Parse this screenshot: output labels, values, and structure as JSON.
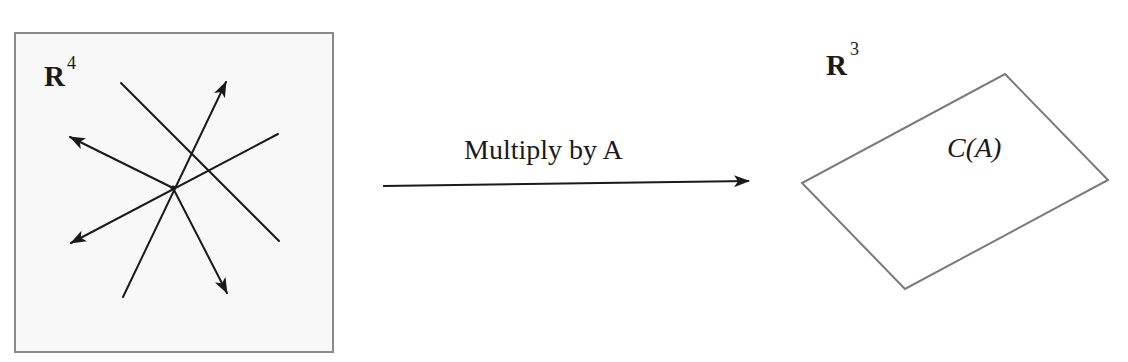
{
  "diagram": {
    "type": "linear-map-column-space",
    "domain_space": {
      "label": "R",
      "exponent": "4",
      "box": {
        "x": 15,
        "y": 33,
        "width": 318,
        "height": 319,
        "stroke": "#8a8a8a",
        "fill": "#f8f8f8"
      },
      "center": [
        173,
        188
      ],
      "lines": [
        {
          "name": "line-1",
          "from": [
            121,
            83
          ],
          "to": [
            279,
            241
          ],
          "arrow_end": false,
          "arrow_start": false
        },
        {
          "name": "line-2",
          "from": [
            123,
            297
          ],
          "to": [
            226,
            82
          ],
          "arrow_end": true
        },
        {
          "name": "line-3",
          "from": [
            278,
            134
          ],
          "to": [
            70,
            243
          ],
          "arrow_end": true
        },
        {
          "name": "line-4",
          "from": [
            70,
            137
          ],
          "to": [
            173,
            188
          ],
          "arrow_start": true
        },
        {
          "name": "line-5",
          "from": [
            173,
            188
          ],
          "to": [
            227,
            293
          ],
          "arrow_end": true
        }
      ]
    },
    "mapping_arrow": {
      "label": "Multiply by A",
      "from": [
        383,
        186
      ],
      "to": [
        749,
        181
      ]
    },
    "codomain_space": {
      "label": "R",
      "exponent": "3",
      "subspace": {
        "label": "C(A)",
        "vertices": [
          [
            1005,
            74
          ],
          [
            1108,
            180
          ],
          [
            905,
            289
          ],
          [
            802,
            183
          ]
        ],
        "stroke": "#7a7a7a"
      }
    },
    "colors": {
      "line": "#1a1a1a",
      "box_border": "#8a8a8a",
      "plane_border": "#7a7a7a",
      "background": "#ffffff"
    }
  }
}
